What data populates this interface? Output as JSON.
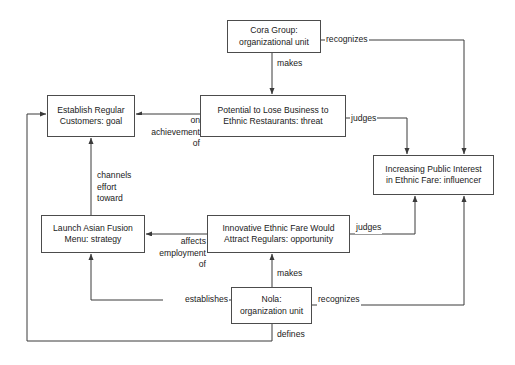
{
  "diagram": {
    "type": "node-edge-diagram",
    "background_color": "#ffffff",
    "node_border_color": "#4c4c4c",
    "text_color": "#1a1a1a",
    "nodes": [
      {
        "id": "cora-group",
        "label": "Cora Group:\norganizational unit",
        "name": "Cora Group",
        "kind": "organizational unit",
        "x": 227,
        "y": 20,
        "w": 94,
        "h": 33
      },
      {
        "id": "potential-lose-business",
        "label": "Potential to Lose Business to\nEthnic Restaurants: threat",
        "name": "Potential to Lose Business to Ethnic Restaurants",
        "kind": "threat",
        "x": 200,
        "y": 95,
        "w": 146,
        "h": 42
      },
      {
        "id": "establish-regular-customers",
        "label": "Establish Regular\nCustomers: goal",
        "name": "Establish Regular Customers",
        "kind": "goal",
        "x": 47,
        "y": 95,
        "w": 88,
        "h": 42
      },
      {
        "id": "increasing-public-interest",
        "label": "Increasing Public Interest\nin Ethnic Fare: influencer",
        "name": "Increasing Public Interest in Ethnic Fare",
        "kind": "influencer",
        "x": 373,
        "y": 155,
        "w": 121,
        "h": 40
      },
      {
        "id": "launch-asian-fusion-menu",
        "label": "Launch Asian Fusion\nMenu: strategy",
        "name": "Launch Asian Fusion Menu",
        "kind": "strategy",
        "x": 41,
        "y": 215,
        "w": 104,
        "h": 38
      },
      {
        "id": "innovative-ethnic-fare",
        "label": "Innovative Ethnic Fare Would\nAttract Regulars: opportunity",
        "name": "Innovative Ethnic Fare Would Attract Regulars",
        "kind": "opportunity",
        "x": 207,
        "y": 215,
        "w": 143,
        "h": 38
      },
      {
        "id": "nola",
        "label": "Nola:\norganization unit",
        "name": "Nola",
        "kind": "organization unit",
        "x": 231,
        "y": 287,
        "w": 81,
        "h": 37
      }
    ],
    "edges": [
      {
        "id": "cora-makes-threat",
        "label": "makes",
        "from": "cora-group",
        "to": "potential-lose-business"
      },
      {
        "id": "cora-recognizes-infl",
        "label": "recognizes",
        "from": "cora-group",
        "to": "increasing-public-interest"
      },
      {
        "id": "threat-on-goal",
        "label": "on\nachievement\nof",
        "from": "potential-lose-business",
        "to": "establish-regular-customers"
      },
      {
        "id": "threat-judges-infl",
        "label": "judges",
        "from": "potential-lose-business",
        "to": "increasing-public-interest"
      },
      {
        "id": "strategy-channels-goal",
        "label": "channels\neffort\ntoward",
        "from": "launch-asian-fusion-menu",
        "to": "establish-regular-customers"
      },
      {
        "id": "opp-affects-strategy",
        "label": "affects\nemployment\nof",
        "from": "innovative-ethnic-fare",
        "to": "launch-asian-fusion-menu"
      },
      {
        "id": "opp-judges-infl",
        "label": "judges",
        "from": "innovative-ethnic-fare",
        "to": "increasing-public-interest"
      },
      {
        "id": "nola-makes-opp",
        "label": "makes",
        "from": "nola",
        "to": "innovative-ethnic-fare"
      },
      {
        "id": "nola-establishes-strat",
        "label": "establishes",
        "from": "nola",
        "to": "launch-asian-fusion-menu"
      },
      {
        "id": "nola-recognizes-infl",
        "label": "recognizes",
        "from": "nola",
        "to": "increasing-public-interest"
      },
      {
        "id": "nola-defines-goal",
        "label": "defines",
        "from": "nola",
        "to": "establish-regular-customers"
      }
    ]
  }
}
